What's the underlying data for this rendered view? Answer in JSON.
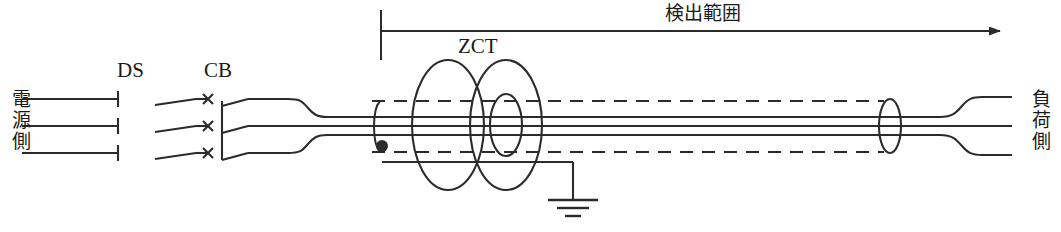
{
  "diagram": {
    "labels": {
      "source_side": "電源源側",
      "source_side_text": "電源側",
      "load_side": "負荷側",
      "disconnect_switch": "DS",
      "circuit_breaker": "CB",
      "zct": "ZCT",
      "detection_range": "検出範囲"
    },
    "colors": {
      "line": "#2b2b2b",
      "text": "#1a1a1a",
      "background": "#ffffff"
    },
    "geometry": {
      "phase_count": 3,
      "phase_y": [
        99,
        126,
        153
      ],
      "arrow_y": 31,
      "arrow_start_x": 381,
      "arrow_end_x": 1008,
      "bracket_tick_x": 381,
      "bracket_tick_top": 10,
      "bracket_tick_bottom": 60,
      "ds_x": 137,
      "cb_x": 224,
      "zct_center_x": 470,
      "ground_x": 573,
      "ground_y": 200,
      "shield_tap_x": 382,
      "shield_tap_y": 146,
      "cable_sheath_left_x": 372,
      "cable_sheath_right_x": 890,
      "sheath_top_y": 101,
      "sheath_bottom_y": 152
    }
  }
}
